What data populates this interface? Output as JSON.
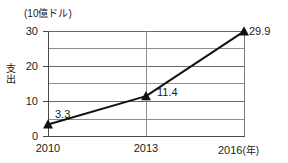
{
  "chart_data": {
    "type": "line",
    "title": "",
    "unit_caption": "(10億ドル)",
    "ylabel": "支出",
    "xlabel": "(年)",
    "categories": [
      "2010",
      "2013",
      "2016"
    ],
    "x_tick_labels": [
      "2010",
      "2013",
      "2016"
    ],
    "x_axis_unit_suffix": "(年)",
    "values": [
      3.3,
      11.4,
      29.9
    ],
    "point_labels": [
      "3.3",
      "11.4",
      "29.9"
    ],
    "y_tick_labels": [
      "0",
      "10",
      "20",
      "30"
    ],
    "y_tick_values": [
      0,
      10,
      20,
      30
    ],
    "y_gridline_values": [
      0,
      5,
      10,
      15,
      20,
      25,
      30
    ],
    "ylim": [
      0,
      30
    ],
    "grid": true,
    "legend": "none",
    "marker": "triangle-up",
    "marker_color": "#111111",
    "line_color": "#111111",
    "background_color": "#ffffff"
  }
}
